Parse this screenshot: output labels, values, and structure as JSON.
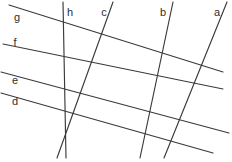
{
  "figure": {
    "type": "line-diagram",
    "width": 232,
    "height": 162,
    "background_color": "#ffffff",
    "stroke_color": "#3a3a3a",
    "label_color": "#2e2e2e",
    "lines": [
      {
        "id": "g",
        "label": "g",
        "orientation": "shallow-descending",
        "x1": 9,
        "y1": 5,
        "x2": 223,
        "y2": 72,
        "label_x": 17,
        "label_y": 21
      },
      {
        "id": "f",
        "label": "f",
        "orientation": "shallow-descending",
        "x1": 3,
        "y1": 44,
        "x2": 223,
        "y2": 89,
        "label_x": 15,
        "label_y": 46
      },
      {
        "id": "e",
        "label": "e",
        "orientation": "shallow-descending",
        "x1": 1,
        "y1": 72,
        "x2": 229,
        "y2": 133,
        "label_x": 15,
        "label_y": 84
      },
      {
        "id": "d",
        "label": "d",
        "orientation": "shallow-descending",
        "x1": 1,
        "y1": 93,
        "x2": 213,
        "y2": 153,
        "label_x": 15,
        "label_y": 105
      },
      {
        "id": "h",
        "label": "h",
        "orientation": "near-vertical",
        "x1": 63,
        "y1": 2,
        "x2": 66,
        "y2": 158,
        "label_x": 70,
        "label_y": 16
      },
      {
        "id": "c",
        "label": "c",
        "orientation": "steep-descending-left",
        "x1": 113,
        "y1": 2,
        "x2": 57,
        "y2": 158,
        "label_x": 104,
        "label_y": 16
      },
      {
        "id": "b",
        "label": "b",
        "orientation": "steep-descending-left",
        "x1": 173,
        "y1": 2,
        "x2": 140,
        "y2": 158,
        "label_x": 163,
        "label_y": 16
      },
      {
        "id": "a",
        "label": "a",
        "orientation": "steep-descending-left",
        "x1": 227,
        "y1": 2,
        "x2": 164,
        "y2": 158,
        "label_x": 217,
        "label_y": 16
      }
    ]
  }
}
